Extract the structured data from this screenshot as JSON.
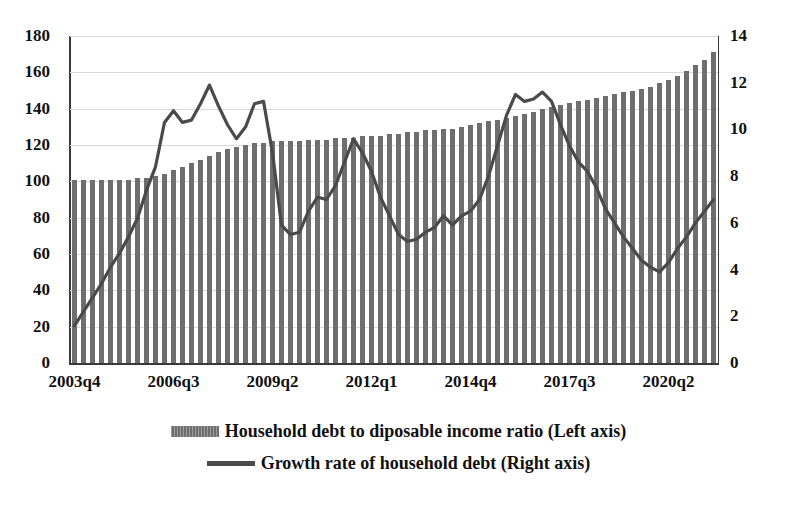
{
  "chart_data": {
    "type": "bar",
    "title": "",
    "xlabel": "",
    "ylabel": "",
    "grid": true,
    "legend_position": "bottom",
    "axes": {
      "left": {
        "label": "Household debt to diposable income ratio",
        "ylim": [
          0,
          180
        ],
        "ticks": [
          0,
          20,
          40,
          60,
          80,
          100,
          120,
          140,
          160,
          180
        ]
      },
      "right": {
        "label": "Growth rate of household debt",
        "ylim": [
          0,
          14
        ],
        "ticks": [
          0,
          2,
          4,
          6,
          8,
          10,
          12,
          14
        ]
      }
    },
    "x_tick_labels": [
      "2003q4",
      "2006q3",
      "2009q2",
      "2012q1",
      "2014q4",
      "2017q3",
      "2020q2"
    ],
    "x_tick_indices": [
      0,
      11,
      22,
      33,
      44,
      55,
      66
    ],
    "categories": [
      "2003q4",
      "2004q1",
      "2004q2",
      "2004q3",
      "2004q4",
      "2005q1",
      "2005q2",
      "2005q3",
      "2005q4",
      "2006q1",
      "2006q2",
      "2006q3",
      "2006q4",
      "2007q1",
      "2007q2",
      "2007q3",
      "2007q4",
      "2008q1",
      "2008q2",
      "2008q3",
      "2008q4",
      "2009q1",
      "2009q2",
      "2009q3",
      "2009q4",
      "2010q1",
      "2010q2",
      "2010q3",
      "2010q4",
      "2011q1",
      "2011q2",
      "2011q3",
      "2011q4",
      "2012q1",
      "2012q2",
      "2012q3",
      "2012q4",
      "2013q1",
      "2013q2",
      "2013q3",
      "2013q4",
      "2014q1",
      "2014q2",
      "2014q3",
      "2014q4",
      "2015q1",
      "2015q2",
      "2015q3",
      "2015q4",
      "2016q1",
      "2016q2",
      "2016q3",
      "2016q4",
      "2017q1",
      "2017q2",
      "2017q3",
      "2017q4",
      "2018q1",
      "2018q2",
      "2018q3",
      "2018q4",
      "2019q1",
      "2019q2",
      "2019q3",
      "2019q4",
      "2020q1",
      "2020q2",
      "2020q3",
      "2020q4",
      "2021q1",
      "2021q2",
      "2021q3"
    ],
    "series": [
      {
        "name": "Household debt to diposable income ratio (Left axis)",
        "type": "bar",
        "axis": "left",
        "color": "#6e6e6e",
        "values": [
          101,
          101,
          101,
          101,
          101,
          101,
          101,
          102,
          102,
          103,
          104,
          106,
          108,
          110,
          112,
          114,
          116,
          118,
          119,
          120,
          121,
          121,
          122,
          122,
          122,
          122,
          123,
          123,
          123,
          124,
          124,
          124,
          125,
          125,
          125,
          126,
          126,
          127,
          127,
          128,
          128,
          129,
          129,
          130,
          131,
          132,
          133,
          134,
          135,
          136,
          137,
          138,
          140,
          141,
          142,
          143,
          144,
          145,
          146,
          147,
          148,
          149,
          150,
          151,
          152,
          154,
          156,
          158,
          161,
          164,
          167,
          171
        ]
      },
      {
        "name": "Growth rate of household debt (Right axis)",
        "type": "line",
        "axis": "right",
        "color": "#4a4a4a",
        "values": [
          1.6,
          2.2,
          2.8,
          3.4,
          4.1,
          4.7,
          5.4,
          6.2,
          7.4,
          8.4,
          10.3,
          10.8,
          10.3,
          10.4,
          11.1,
          11.9,
          11.0,
          10.2,
          9.6,
          10.1,
          11.1,
          11.2,
          9.0,
          5.9,
          5.5,
          5.6,
          6.5,
          7.1,
          7.0,
          7.6,
          8.6,
          9.6,
          9.0,
          8.2,
          7.1,
          6.3,
          5.5,
          5.2,
          5.3,
          5.6,
          5.8,
          6.3,
          5.9,
          6.3,
          6.5,
          7.0,
          8.0,
          9.3,
          10.6,
          11.5,
          11.2,
          11.3,
          11.6,
          11.2,
          10.2,
          9.3,
          8.6,
          8.2,
          7.5,
          6.6,
          6.0,
          5.4,
          4.9,
          4.4,
          4.1,
          3.9,
          4.3,
          4.9,
          5.4,
          6.0,
          6.5,
          7.0
        ]
      }
    ]
  },
  "legend": [
    {
      "swatch": "bar-swatch",
      "label": "Household debt to diposable income ratio (Left axis)"
    },
    {
      "swatch": "line-swatch",
      "label": "Growth rate of household debt (Right axis)"
    }
  ]
}
